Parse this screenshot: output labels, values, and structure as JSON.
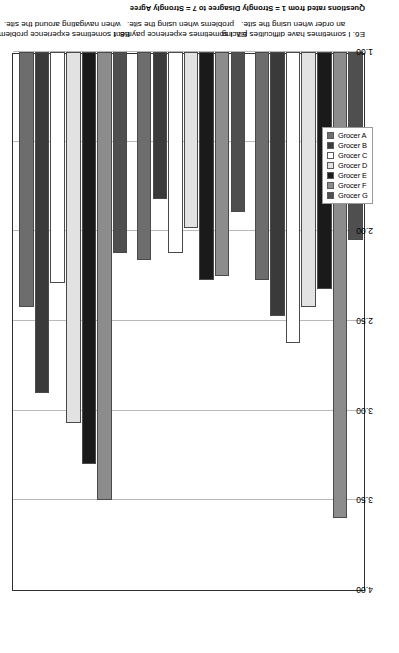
{
  "chart_data": {
    "type": "bar",
    "orientation": "horizontal-rotated",
    "title": "",
    "xlabel": "Questions rated from 1 = Strongly Disagree to 7 = Strongly Agree",
    "ylabel": "",
    "ylim": [
      1.0,
      4.0
    ],
    "ticks": [
      "4.00",
      "3.50",
      "3.00",
      "2.50",
      "2.00",
      "1.50",
      "1.00"
    ],
    "tick_values": [
      4.0,
      3.5,
      3.0,
      2.5,
      2.0,
      1.5,
      1.0
    ],
    "grid": true,
    "legend_position": "top",
    "categories": [
      "E8. I sometimes experience  problems when navigating around the site.",
      "E7. I sometimes experience payment problems when using the site.",
      "E6. I sometimes have difficulties placing an order when using the site."
    ],
    "category_lines": [
      [
        "E8. I sometimes experience  problems",
        "when navigating around the site."
      ],
      [
        "E7. I sometimes experience payment",
        "problems when using the site."
      ],
      [
        "E6. I sometimes have difficulties placing",
        "an order when using the site."
      ]
    ],
    "series": [
      {
        "name": "Grocer A",
        "color": "#6d6d6d",
        "values": [
          2.42,
          2.16,
          2.27
        ]
      },
      {
        "name": "Grocer B",
        "color": "#3a3a3a",
        "values": [
          2.9,
          1.82,
          2.47
        ]
      },
      {
        "name": "Grocer C",
        "color": "#ffffff",
        "values": [
          2.29,
          2.12,
          2.62
        ]
      },
      {
        "name": "Grocer D",
        "color": "#e2e2e2",
        "values": [
          3.07,
          1.98,
          2.42
        ]
      },
      {
        "name": "Grocer E",
        "color": "#1a1a1a",
        "values": [
          3.3,
          2.27,
          2.32
        ]
      },
      {
        "name": "Grocer F",
        "color": "#8c8c8c",
        "values": [
          3.5,
          2.25,
          3.6
        ]
      },
      {
        "name": "Grocer G",
        "color": "#4f4f4f",
        "values": [
          2.12,
          1.89,
          2.05
        ]
      }
    ]
  },
  "legend": {
    "items": [
      {
        "label": "Grocer A",
        "color": "#6d6d6d"
      },
      {
        "label": "Grocer B",
        "color": "#3a3a3a"
      },
      {
        "label": "Grocer C",
        "color": "#ffffff"
      },
      {
        "label": "Grocer D",
        "color": "#e2e2e2"
      },
      {
        "label": "Grocer E",
        "color": "#1a1a1a"
      },
      {
        "label": "Grocer F",
        "color": "#8c8c8c"
      },
      {
        "label": "Grocer G",
        "color": "#4f4f4f"
      }
    ]
  }
}
